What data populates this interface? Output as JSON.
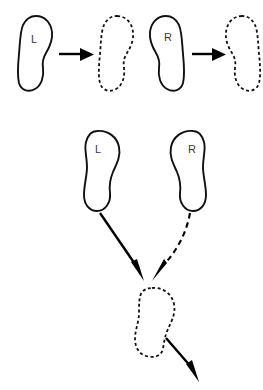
{
  "figure": {
    "title": "",
    "background_color": "#ffffff",
    "line_color": "#111111",
    "label_color": "#3a3a3a",
    "width": 263,
    "height": 390
  },
  "rows": {
    "top": {
      "description": "single-foot transitions",
      "items": [
        {
          "label": "L",
          "style": "solid",
          "name": "left-foot-source"
        },
        {
          "label": "",
          "style": "dashed",
          "name": "left-foot-target"
        },
        {
          "label": "R",
          "style": "solid",
          "name": "right-foot-source"
        },
        {
          "label": "",
          "style": "dashed",
          "name": "right-foot-target"
        }
      ],
      "arrows": [
        {
          "style": "solid",
          "direction": "right",
          "name": "left-transition-arrow"
        },
        {
          "style": "solid",
          "direction": "right",
          "name": "right-transition-arrow"
        }
      ]
    },
    "bottom": {
      "description": "two feet converging to one",
      "items": [
        {
          "label": "L",
          "style": "solid",
          "name": "bottom-left-foot"
        },
        {
          "label": "R",
          "style": "solid",
          "name": "bottom-right-foot"
        },
        {
          "label": "",
          "style": "dashed",
          "name": "bottom-merged-foot"
        }
      ],
      "arrows": [
        {
          "style": "solid",
          "direction": "down-right",
          "name": "left-converge-arrow"
        },
        {
          "style": "dashed",
          "direction": "down-left",
          "name": "right-converge-arrow"
        },
        {
          "style": "solid",
          "direction": "down-right",
          "name": "exit-arrow"
        }
      ]
    }
  },
  "labels": {
    "top_left": "L",
    "top_right": "R",
    "bottom_left": "L",
    "bottom_right": "R"
  }
}
